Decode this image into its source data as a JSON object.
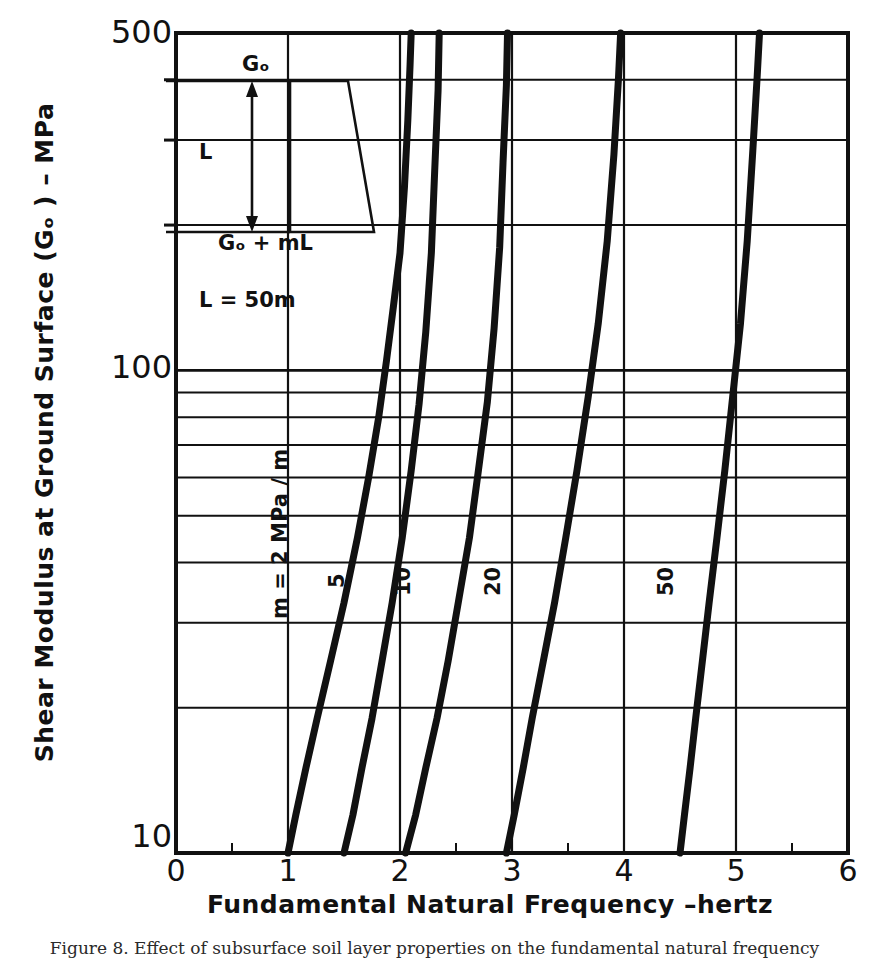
{
  "figure": {
    "caption": "Figure 8.   Effect of subsurface soil layer properties on the fundamental natural frequency"
  },
  "axes": {
    "x": {
      "label": "Fundamental Natural Frequency –hertz",
      "ticks": [
        "0",
        "1",
        "2",
        "3",
        "4",
        "5",
        "6"
      ],
      "min": 0,
      "max": 6
    },
    "y": {
      "label": "Shear Modulus at Ground Surface (Gₒ ) – MPa",
      "ticks": [
        "500",
        "100",
        "10"
      ],
      "min": 10,
      "max": 500,
      "scale": "log"
    }
  },
  "inset": {
    "top_label": "Gₒ",
    "side_label": "L",
    "bottom_label": "Gₒ + mL",
    "note": "L = 50m"
  },
  "curve_labels": {
    "first": "m = 2 MPa / m",
    "second": "5",
    "third": "10",
    "fourth": "20",
    "fifth": "50"
  },
  "colors": {
    "ink": "#111111",
    "grid": "#111111",
    "background": "#ffffff"
  },
  "chart_data": {
    "type": "line",
    "title": "",
    "xlabel": "Fundamental Natural Frequency –hertz",
    "ylabel": "Shear Modulus at Ground Surface (Gₒ ) – MPa",
    "xlim": [
      0,
      6
    ],
    "ylim": [
      10,
      500
    ],
    "yscale": "log",
    "xscale": "linear",
    "grid": true,
    "legend": "inline-curve-labels",
    "xticks": [
      0,
      1,
      2,
      3,
      4,
      5,
      6
    ],
    "yticks": [
      10,
      100,
      500
    ],
    "y_minor_gridlines": [
      20,
      30,
      40,
      50,
      60,
      70,
      80,
      90,
      200,
      300,
      400
    ],
    "annotations": [
      {
        "text": "L = 50m",
        "x": 0.55,
        "y": 175
      },
      {
        "text": "m = 2 MPa / m",
        "x": 0.95,
        "y": 45
      },
      {
        "text": "5",
        "x": 1.42,
        "y": 42
      },
      {
        "text": "10",
        "x": 1.98,
        "y": 42
      },
      {
        "text": "20",
        "x": 2.78,
        "y": 42
      },
      {
        "text": "50",
        "x": 4.32,
        "y": 42
      }
    ],
    "series": [
      {
        "name": "m = 2 MPa/m",
        "x": [
          1.0,
          1.07,
          1.16,
          1.26,
          1.38,
          1.5,
          1.62,
          1.72,
          1.81,
          1.88,
          1.94,
          2.0,
          2.04,
          2.07,
          2.09,
          2.1
        ],
        "y": [
          10,
          12,
          15,
          19,
          25,
          33,
          45,
          60,
          80,
          105,
          135,
          175,
          240,
          330,
          430,
          500
        ]
      },
      {
        "name": "5",
        "x": [
          1.5,
          1.58,
          1.66,
          1.75,
          1.84,
          1.93,
          2.02,
          2.1,
          2.17,
          2.23,
          2.28,
          2.31,
          2.34,
          2.35
        ],
        "y": [
          10,
          12,
          15,
          19,
          25,
          33,
          45,
          62,
          85,
          120,
          175,
          260,
          380,
          500
        ]
      },
      {
        "name": "10",
        "x": [
          2.05,
          2.14,
          2.23,
          2.33,
          2.43,
          2.52,
          2.62,
          2.7,
          2.78,
          2.84,
          2.89,
          2.92,
          2.95,
          2.96
        ],
        "y": [
          10,
          12,
          15,
          19,
          25,
          33,
          45,
          62,
          86,
          122,
          180,
          270,
          390,
          500
        ]
      },
      {
        "name": "20",
        "x": [
          2.95,
          3.02,
          3.1,
          3.18,
          3.28,
          3.38,
          3.48,
          3.58,
          3.68,
          3.77,
          3.85,
          3.91,
          3.95,
          3.97
        ],
        "y": [
          10,
          12,
          15,
          19,
          25,
          33,
          45,
          62,
          88,
          125,
          185,
          280,
          400,
          500
        ]
      },
      {
        "name": "50",
        "x": [
          4.5,
          4.54,
          4.59,
          4.64,
          4.7,
          4.76,
          4.83,
          4.9,
          4.97,
          5.04,
          5.1,
          5.15,
          5.19,
          5.21
        ],
        "y": [
          10,
          12,
          15,
          19,
          25,
          33,
          45,
          62,
          88,
          125,
          185,
          285,
          410,
          500
        ]
      }
    ]
  }
}
